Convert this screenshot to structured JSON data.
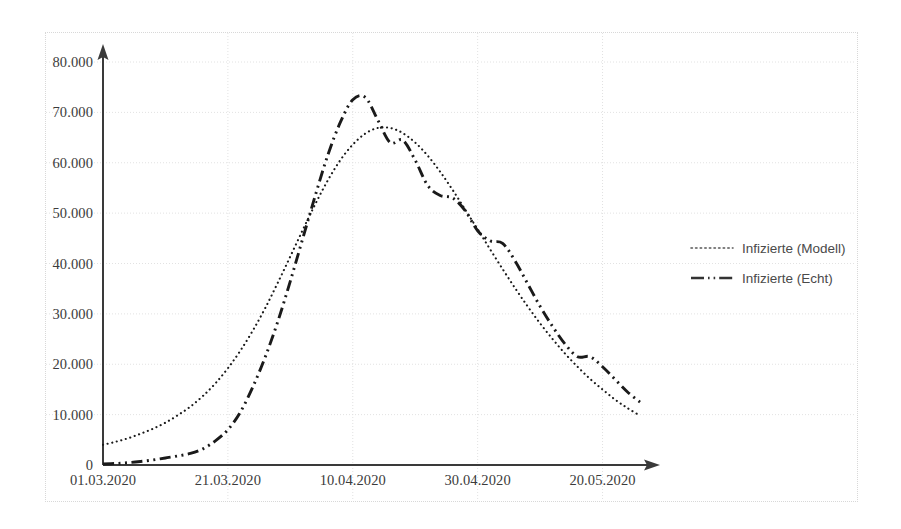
{
  "chart_data": {
    "type": "line",
    "title": "",
    "subtitle": "",
    "xlabel": "",
    "ylabel": "",
    "grid": true,
    "legend_position": "right",
    "xlim": [
      "01.03.2020",
      "25.05.2020"
    ],
    "ylim": [
      0,
      80000
    ],
    "x_tick_labels": [
      "01.03.2020",
      "21.03.2020",
      "10.04.2020",
      "30.04.2020",
      "20.05.2020"
    ],
    "x_tick_days": [
      0,
      20,
      40,
      60,
      80
    ],
    "y_tick_labels": [
      "0",
      "10.000",
      "20.000",
      "30.000",
      "40.000",
      "50.000",
      "60.000",
      "70.000",
      "80.000"
    ],
    "y_tick_values": [
      0,
      10000,
      20000,
      30000,
      40000,
      50000,
      60000,
      70000,
      80000
    ],
    "x_day_range": [
      0,
      86
    ],
    "series": [
      {
        "name": "Infizierte (Modell)",
        "style": "dotted",
        "color": "#1a1a1a",
        "x": [
          0,
          2,
          4,
          6,
          8,
          10,
          12,
          14,
          16,
          18,
          20,
          22,
          24,
          26,
          28,
          30,
          32,
          34,
          36,
          38,
          40,
          42,
          44,
          46,
          48,
          50,
          52,
          54,
          56,
          58,
          60,
          62,
          64,
          66,
          68,
          70,
          72,
          74,
          76,
          78,
          80,
          82,
          84,
          86
        ],
        "values": [
          4000,
          4600,
          5300,
          6200,
          7200,
          8400,
          9900,
          11600,
          13700,
          16200,
          19200,
          22700,
          26700,
          31200,
          36200,
          41400,
          46700,
          51800,
          56500,
          60500,
          63600,
          65800,
          66900,
          66900,
          65900,
          64000,
          61400,
          58200,
          54600,
          50700,
          46800,
          42800,
          38900,
          35100,
          31500,
          28100,
          25000,
          22100,
          19500,
          17100,
          15000,
          13000,
          11300,
          9800
        ]
      },
      {
        "name": "Infizierte (Echt)",
        "style": "dash-dot",
        "color": "#1a1a1a",
        "x": [
          0,
          2,
          4,
          6,
          8,
          10,
          12,
          14,
          16,
          18,
          20,
          22,
          24,
          26,
          28,
          30,
          32,
          34,
          36,
          38,
          40,
          42,
          44,
          46,
          48,
          50,
          52,
          54,
          56,
          58,
          60,
          62,
          64,
          66,
          68,
          70,
          72,
          74,
          76,
          78,
          80,
          82,
          84,
          86
        ],
        "values": [
          200,
          300,
          450,
          700,
          1000,
          1400,
          1800,
          2300,
          3200,
          4800,
          7000,
          10500,
          15500,
          21500,
          28500,
          36500,
          45000,
          53500,
          61500,
          68000,
          72500,
          73000,
          68500,
          64000,
          64500,
          60500,
          55500,
          53500,
          53000,
          50500,
          46500,
          44500,
          44000,
          40500,
          36000,
          31500,
          27500,
          24000,
          21500,
          21500,
          19500,
          17000,
          14500,
          12500
        ]
      }
    ],
    "peaks": {
      "model_peak_value": 66900,
      "model_peak_label": "10.04.2020",
      "real_peak_value": 73000,
      "real_peak_label": "08.04.2020"
    }
  },
  "legend": {
    "items": [
      {
        "label": "Infizierte (Modell)",
        "style": "dotted"
      },
      {
        "label": "Infizierte (Echt)",
        "style": "dash-dot"
      }
    ]
  },
  "axes": {
    "y_arrow": true,
    "x_arrow": true,
    "axis_color": "#3a3a3a",
    "grid_color": "#e2e2e2"
  }
}
